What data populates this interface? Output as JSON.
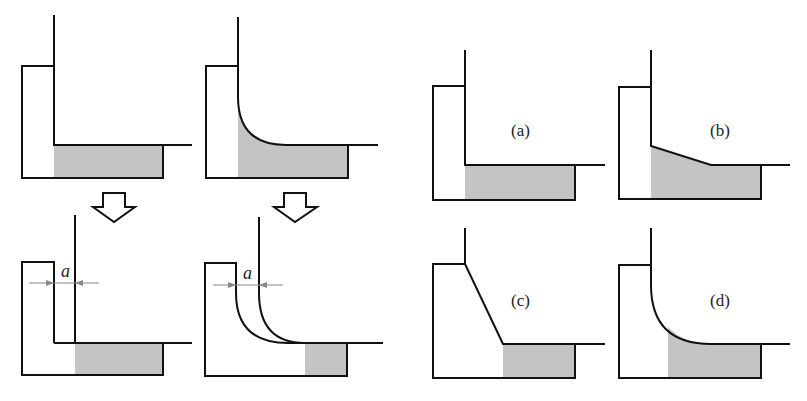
{
  "figure": {
    "left_panel": {
      "description": "Weld joint transformation: straight and curved wall, before and after displacement a",
      "dimension_label": "a"
    },
    "right_panel": {
      "labels": [
        "(a)",
        "(b)",
        "(c)",
        "(d)"
      ]
    },
    "colors": {
      "line": "#111111",
      "shade": "#c4c4c4",
      "dimension": "#888888"
    }
  }
}
